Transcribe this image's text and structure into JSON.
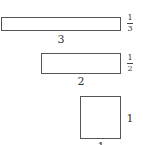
{
  "diagram": {
    "shapes": [
      {
        "id": "rect-a",
        "width_label": "3",
        "height_label": {
          "numerator": "1",
          "denominator": "3"
        },
        "box": {
          "left": 1,
          "top": 17,
          "width": 120,
          "height": 14
        }
      },
      {
        "id": "rect-b",
        "width_label": "2",
        "height_label": {
          "numerator": "1",
          "denominator": "2"
        },
        "box": {
          "left": 41,
          "top": 53,
          "width": 80,
          "height": 21
        }
      },
      {
        "id": "square-c",
        "width_label": "1",
        "height_label": "1",
        "box": {
          "left": 80,
          "top": 96,
          "width": 41,
          "height": 43
        }
      }
    ],
    "stroke_color": "#555555",
    "text_color": "#333333"
  }
}
